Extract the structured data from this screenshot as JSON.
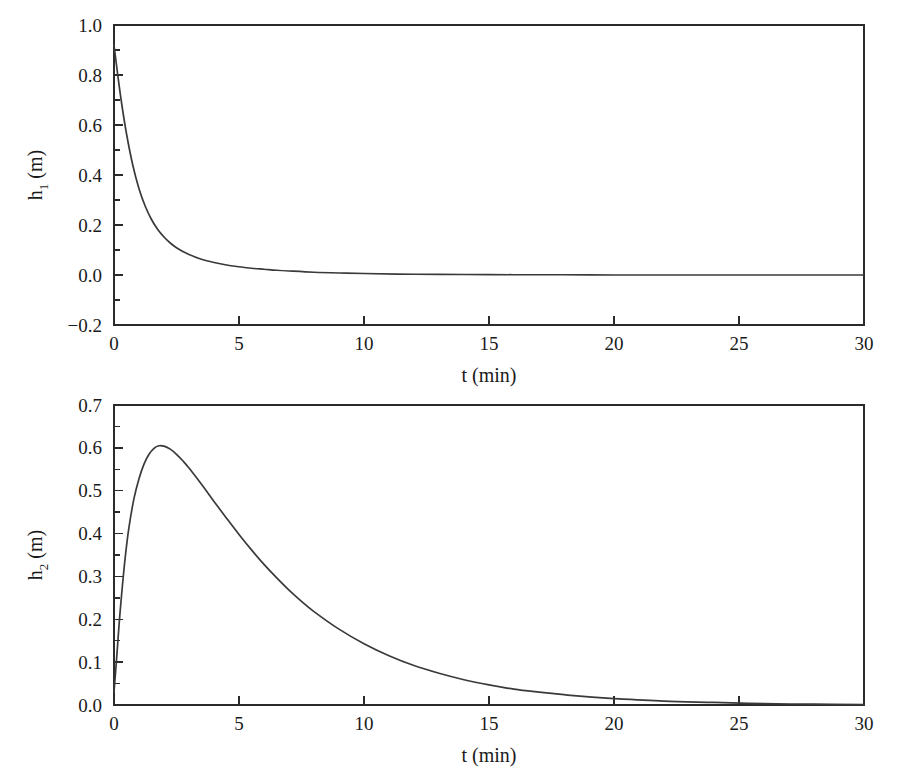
{
  "figure": {
    "background_color": "#ffffff",
    "line_color": "#3a3a3a",
    "axis_color": "#2b2b2b"
  },
  "chart_data": [
    {
      "type": "line",
      "id": "h1-vs-t",
      "title": "",
      "subtitle": "",
      "xlabel": "t (min)",
      "ylabel": "h₁ (m)",
      "ylabel_base": "h",
      "ylabel_subscript": "1",
      "ylabel_units": " (m)",
      "xlim": [
        0,
        30
      ],
      "ylim": [
        -0.2,
        1.0
      ],
      "xticks": [
        0,
        5,
        10,
        15,
        20,
        25,
        30
      ],
      "xtick_labels": [
        "0",
        "5",
        "10",
        "15",
        "20",
        "25",
        "30"
      ],
      "yticks": [
        -0.2,
        0.0,
        0.2,
        0.4,
        0.6,
        0.8,
        1.0
      ],
      "ytick_labels": [
        "-0.2",
        "0.0",
        "0.2",
        "0.4",
        "0.6",
        "0.8",
        "1.0"
      ],
      "y_minor_ticks": [
        -0.1,
        0.1,
        0.3,
        0.5,
        0.7,
        0.9
      ],
      "grid": false,
      "legend": false,
      "legend_position": "none",
      "series": [
        {
          "name": "h1",
          "x": [
            0,
            0.15,
            0.3,
            0.5,
            0.75,
            1.0,
            1.25,
            1.5,
            1.75,
            2.0,
            2.25,
            2.5,
            2.75,
            3.0,
            3.5,
            4.0,
            4.5,
            5.0,
            5.5,
            6.0,
            6.5,
            7.0,
            8.0,
            9.0,
            10.0,
            12.0,
            14.0,
            16.0,
            18.0,
            20.0,
            22.0,
            25.0,
            27.5,
            30.0
          ],
          "y": [
            0.92,
            0.8,
            0.69,
            0.565,
            0.44,
            0.345,
            0.275,
            0.222,
            0.182,
            0.152,
            0.128,
            0.109,
            0.094,
            0.082,
            0.063,
            0.05,
            0.04,
            0.033,
            0.027,
            0.023,
            0.019,
            0.016,
            0.011,
            0.008,
            0.006,
            0.003,
            0.002,
            0.001,
            0.001,
            0.0,
            0.0,
            0.0,
            0.0,
            0.0
          ]
        }
      ]
    },
    {
      "type": "line",
      "id": "h2-vs-t",
      "title": "",
      "subtitle": "",
      "xlabel": "t (min)",
      "ylabel": "h₂ (m)",
      "ylabel_base": "h",
      "ylabel_subscript": "2",
      "ylabel_units": " (m)",
      "xlim": [
        0,
        30
      ],
      "ylim": [
        0.0,
        0.7
      ],
      "xticks": [
        0,
        5,
        10,
        15,
        20,
        25,
        30
      ],
      "xtick_labels": [
        "0",
        "5",
        "10",
        "15",
        "20",
        "25",
        "30"
      ],
      "yticks": [
        0.0,
        0.1,
        0.2,
        0.3,
        0.4,
        0.5,
        0.6,
        0.7
      ],
      "ytick_labels": [
        "0.0",
        "0.1",
        "0.2",
        "0.3",
        "0.4",
        "0.5",
        "0.6",
        "0.7"
      ],
      "y_minor_ticks": [
        0.05,
        0.15,
        0.25,
        0.35,
        0.45,
        0.55,
        0.65
      ],
      "grid": false,
      "legend": false,
      "legend_position": "none",
      "peak": {
        "x": 1.8,
        "y": 0.605
      },
      "series": [
        {
          "name": "h2",
          "x": [
            0,
            0.1,
            0.2,
            0.3,
            0.45,
            0.6,
            0.8,
            1.0,
            1.2,
            1.4,
            1.6,
            1.8,
            2.0,
            2.25,
            2.5,
            2.75,
            3.0,
            3.5,
            4.0,
            4.5,
            5.0,
            5.5,
            6.0,
            6.5,
            7.0,
            7.5,
            8.0,
            9.0,
            10.0,
            11.0,
            12.0,
            13.0,
            14.0,
            15.0,
            16.0,
            17.0,
            18.0,
            19.0,
            20.0,
            22.0,
            24.0,
            26.0,
            28.0,
            30.0
          ],
          "y": [
            0.03,
            0.105,
            0.185,
            0.255,
            0.345,
            0.415,
            0.482,
            0.528,
            0.562,
            0.585,
            0.599,
            0.605,
            0.604,
            0.597,
            0.585,
            0.57,
            0.553,
            0.515,
            0.475,
            0.436,
            0.398,
            0.362,
            0.328,
            0.297,
            0.268,
            0.242,
            0.218,
            0.177,
            0.143,
            0.115,
            0.092,
            0.074,
            0.059,
            0.047,
            0.037,
            0.03,
            0.024,
            0.019,
            0.015,
            0.009,
            0.006,
            0.003,
            0.002,
            0.001
          ]
        }
      ]
    }
  ]
}
